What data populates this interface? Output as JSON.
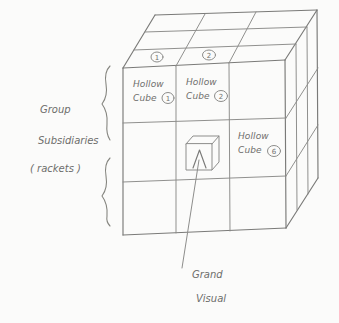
{
  "diagram": {
    "medium": "hand-drawn pencil sketch",
    "ink_color": "#7a7a78",
    "background_color": "#fbfbfa"
  },
  "cube": {
    "description": "isometric 3x3 cube",
    "rows": 3,
    "cols": 3,
    "faces": [
      "front",
      "top",
      "right"
    ],
    "top_face_numbers": [
      "1",
      "2"
    ],
    "cells": [
      {
        "position": "row1-col1",
        "label_line1": "Hollow",
        "label_line2": "Cube",
        "number": "1"
      },
      {
        "position": "row1-col2",
        "label_line1": "Hollow",
        "label_line2": "Cube",
        "number": "2"
      },
      {
        "position": "row2-col3",
        "label_line1": "Hollow",
        "label_line2": "Cube",
        "number": "6"
      }
    ],
    "inner_glyph": {
      "name": "small-cube-with-arrow",
      "position": "row2-col2",
      "description": "small 3D box with upward arrow inside"
    }
  },
  "annotations": {
    "left_label": {
      "line1": "Group",
      "line2": "Subsidiaries",
      "line3": "( rackets )",
      "braces": 2
    },
    "bottom_caption": {
      "line1": "Grand",
      "line2": "Visual",
      "leader_line": true
    }
  }
}
